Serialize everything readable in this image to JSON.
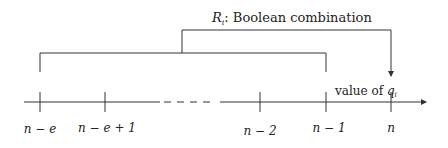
{
  "diagram": {
    "title_var": "R",
    "title_sub": "i",
    "title_text": ": Boolean combination",
    "axis_label_text": "value of ",
    "axis_label_var": "q",
    "axis_label_sub": "i",
    "ticks": [
      {
        "label": "n − e",
        "x": 40
      },
      {
        "label": "n − e + 1",
        "x": 105
      },
      {
        "label": "n − 2",
        "x": 260
      },
      {
        "label": "n − 1",
        "x": 326
      },
      {
        "label": "n",
        "x": 391
      }
    ],
    "colors": {
      "line": "#333333",
      "text": "#222222",
      "background": "#ffffff"
    }
  }
}
